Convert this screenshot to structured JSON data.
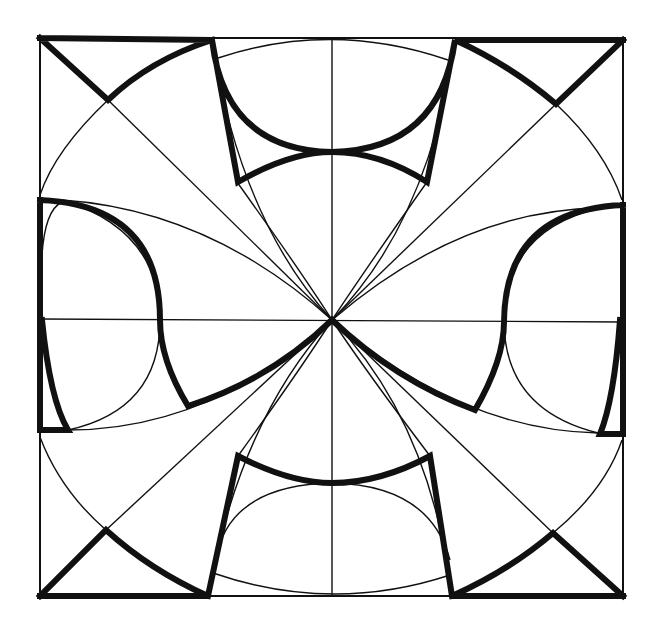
{
  "figure": {
    "type": "geometric construction",
    "caption_visible": "partially cut off (illegible)"
  },
  "geometry": {
    "frame": {
      "left": 40,
      "top": 38,
      "right": 623,
      "bottom": 596
    },
    "center": {
      "x": 332,
      "y": 320
    }
  },
  "colors": {
    "line": "#111111",
    "background": "#ffffff"
  }
}
